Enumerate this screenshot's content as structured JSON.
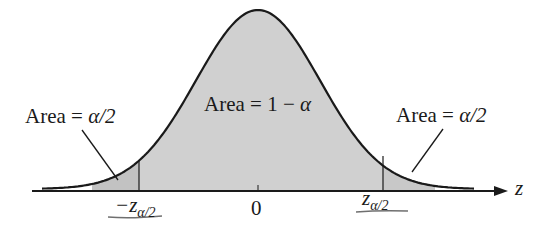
{
  "diagram": {
    "type": "standard-normal-two-tailed",
    "axis_label": "z",
    "center_tick_label": "0",
    "labels": {
      "left_tail": {
        "prefix": "Area = ",
        "value": "α/2"
      },
      "center": {
        "prefix": "Area = 1 − ",
        "value": "α"
      },
      "right_tail": {
        "prefix": "Area = ",
        "value": "α/2"
      }
    },
    "critical_values": {
      "left": {
        "main": "−z",
        "sub": "α/2"
      },
      "right": {
        "main": "z",
        "sub": "α/2"
      }
    },
    "colors": {
      "curve": "#1a1a1a",
      "fill_center": "#d0d0d0",
      "fill_tails": "#c4c4c4",
      "underline": "#6f6f6f"
    }
  }
}
